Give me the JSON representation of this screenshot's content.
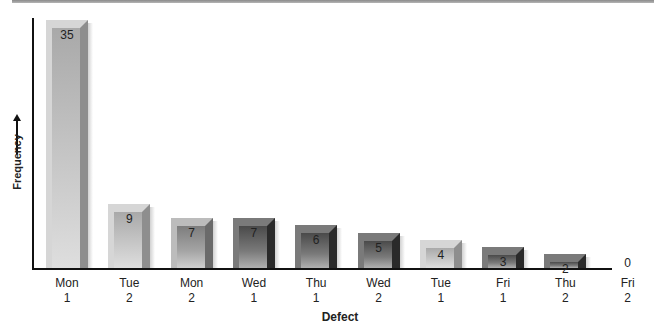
{
  "chart_data": {
    "type": "bar",
    "title": "",
    "xlabel": "Defect",
    "ylabel": "Frequency",
    "categories": [
      "Mon 1",
      "Tue 2",
      "Mon 2",
      "Wed 1",
      "Thu 1",
      "Wed 2",
      "Tue 1",
      "Fri 1",
      "Thu 2",
      "Fri 2"
    ],
    "category_lines": [
      [
        "Mon",
        "1"
      ],
      [
        "Tue",
        "2"
      ],
      [
        "Mon",
        "2"
      ],
      [
        "Wed",
        "1"
      ],
      [
        "Thu",
        "1"
      ],
      [
        "Wed",
        "2"
      ],
      [
        "Tue",
        "1"
      ],
      [
        "Fri",
        "1"
      ],
      [
        "Thu",
        "2"
      ],
      [
        "Fri",
        "2"
      ]
    ],
    "values": [
      35,
      9,
      7,
      7,
      6,
      5,
      4,
      3,
      2,
      0
    ],
    "value_labels": [
      "35",
      "9",
      "7",
      "7",
      "6",
      "5",
      "4",
      "3",
      "2",
      "0"
    ],
    "ylim": [
      0,
      35
    ],
    "grid": false,
    "legend": null,
    "bar_styles": [
      "light",
      "light",
      "medium",
      "dark",
      "dark",
      "dark",
      "light",
      "dark",
      "dark",
      "none"
    ]
  },
  "labels": {
    "ylabel": "Frequency",
    "xlabel": "Defect"
  }
}
